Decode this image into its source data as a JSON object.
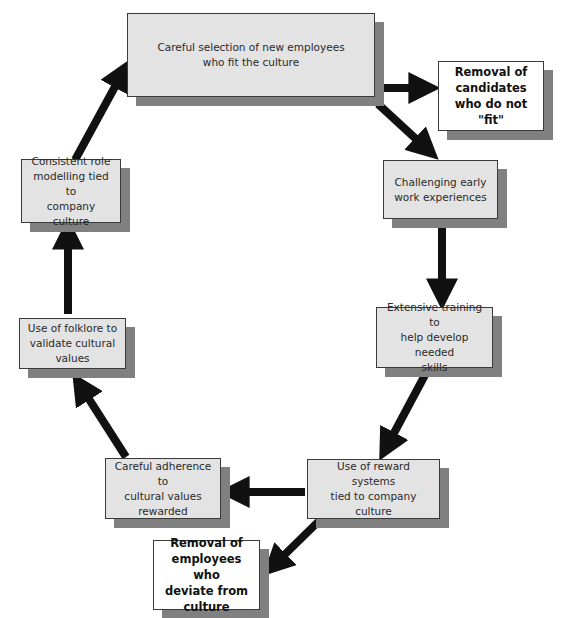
{
  "diagram": {
    "type": "cycle-flow",
    "colors": {
      "box_fill": "#e3e3e3",
      "box_shadow": "#808080",
      "highlight_fill": "#ffffff",
      "arrow": "#111111"
    },
    "nodes": [
      {
        "id": "selection",
        "label": "Careful selection of new employees\nwho fit the culture"
      },
      {
        "id": "removal_candidates",
        "label": "Removal of\ncandidates\nwho do not \"fit\"",
        "emphasis": true
      },
      {
        "id": "challenging",
        "label": "Challenging early\nwork experiences"
      },
      {
        "id": "training",
        "label": "Extensive training to\nhelp develop needed\nskills"
      },
      {
        "id": "reward",
        "label": "Use of reward systems\ntied to company\nculture"
      },
      {
        "id": "adherence",
        "label": "Careful adherence to\ncultural values\nrewarded"
      },
      {
        "id": "removal_employees",
        "label": "Removal of\nemployees who\ndeviate from\nculture",
        "emphasis": true
      },
      {
        "id": "folklore",
        "label": "Use of folklore to\nvalidate cultural\nvalues"
      },
      {
        "id": "role_modelling",
        "label": "Consistent role\nmodelling tied to\ncompany culture"
      }
    ],
    "edges": [
      {
        "from": "selection",
        "to": "removal_candidates"
      },
      {
        "from": "selection",
        "to": "challenging"
      },
      {
        "from": "challenging",
        "to": "training"
      },
      {
        "from": "training",
        "to": "reward"
      },
      {
        "from": "reward",
        "to": "adherence"
      },
      {
        "from": "reward",
        "to": "removal_employees"
      },
      {
        "from": "adherence",
        "to": "folklore"
      },
      {
        "from": "folklore",
        "to": "role_modelling"
      },
      {
        "from": "role_modelling",
        "to": "selection"
      }
    ]
  }
}
